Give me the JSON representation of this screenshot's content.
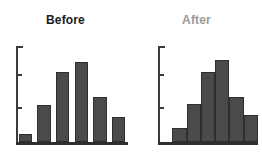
{
  "figure": {
    "width": 262,
    "height": 164,
    "background": "#ffffff",
    "bar_fill": "#4a4a4a",
    "bar_stroke": "#2e2e2e",
    "axis_color": "#3a3a3a",
    "title_color_before": "#1c1c1c",
    "title_color_after": "#9a9a9a"
  },
  "chart_data": [
    {
      "type": "bar",
      "title": "Before",
      "xlabel": "",
      "ylabel": "",
      "categories": [
        "1",
        "2",
        "3",
        "4",
        "5",
        "6"
      ],
      "values": [
        8,
        37,
        70,
        80,
        45,
        25
      ],
      "ylim": [
        0,
        96
      ],
      "grid": false,
      "legend": "none",
      "axis_ticks_y": [
        33,
        66
      ],
      "bar_gap": true,
      "notes": "Left panel histogram, dark bold title, separated bars"
    },
    {
      "type": "bar",
      "title": "After",
      "xlabel": "",
      "ylabel": "",
      "categories": [
        "1",
        "2",
        "3",
        "4",
        "5",
        "6"
      ],
      "values": [
        0,
        14,
        38,
        70,
        82,
        45,
        27
      ],
      "ylim": [
        0,
        96
      ],
      "grid": false,
      "legend": "none",
      "axis_ticks_y": [
        33,
        66
      ],
      "bar_gap": false,
      "notes": "Right panel histogram, gray title, contiguous bars"
    }
  ],
  "panels": [
    {
      "id": "before",
      "title": "Before",
      "bars": [
        {
          "label": "bin-1",
          "value": 8
        },
        {
          "label": "bin-2",
          "value": 37
        },
        {
          "label": "bin-3",
          "value": 70
        },
        {
          "label": "bin-4",
          "value": 80
        },
        {
          "label": "bin-5",
          "value": 45
        },
        {
          "label": "bin-6",
          "value": 25
        }
      ]
    },
    {
      "id": "after",
      "title": "After",
      "bars": [
        {
          "label": "bin-1",
          "value": 0
        },
        {
          "label": "bin-2",
          "value": 14
        },
        {
          "label": "bin-3",
          "value": 38
        },
        {
          "label": "bin-4",
          "value": 70
        },
        {
          "label": "bin-5",
          "value": 82
        },
        {
          "label": "bin-6",
          "value": 45
        },
        {
          "label": "bin-7",
          "value": 27
        }
      ]
    }
  ]
}
